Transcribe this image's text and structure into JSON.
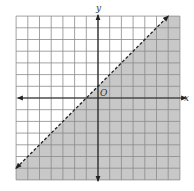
{
  "chart_data": {
    "type": "line",
    "title": "",
    "xlabel": "x",
    "ylabel": "y",
    "origin_label": "O",
    "xlim": [
      -7,
      7
    ],
    "ylim": [
      -7,
      7
    ],
    "grid": true,
    "grid_step": 1,
    "tick_labels": false,
    "series": [
      {
        "name": "boundary",
        "equation": "y = x + 1",
        "style": "dashed",
        "x": [
          -7,
          6
        ],
        "y": [
          -6,
          7
        ]
      }
    ],
    "shaded_region": {
      "inequality": "y < x + 1",
      "side": "below-right",
      "color": "#c8c8c8"
    }
  },
  "colors": {
    "grid": "#8a8a8a",
    "axis": "#222222",
    "shade": "#c8c8c8",
    "line": "#222222"
  }
}
